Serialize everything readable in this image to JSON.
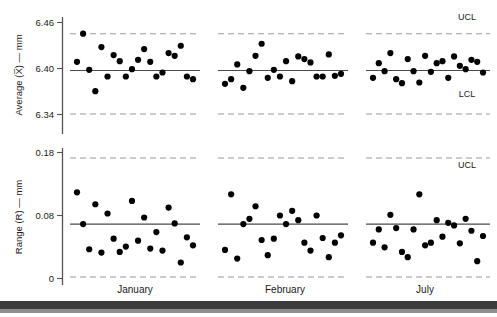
{
  "figure": {
    "title": "",
    "background_color": "#ffffff",
    "dot_color": "#000000",
    "center_line_color": "#4a4a4a",
    "limit_line_color": "#9a9a9a",
    "axis_color": "#555555",
    "footer_bar_color": "#3c3c3c",
    "footer_bar_shadow_color": "#8e8e8e"
  },
  "periods": [
    {
      "id": "january",
      "label": "January"
    },
    {
      "id": "february",
      "label": "February"
    },
    {
      "id": "july",
      "label": "July"
    }
  ],
  "limit_labels": {
    "ucl": "UCL",
    "lcl": "LCL"
  },
  "chart_data": [
    {
      "type": "scatter",
      "id": "xbar-chart",
      "title": "",
      "xlabel": "",
      "ylabel": "Average (X̅) — mm",
      "ylim": [
        6.31,
        6.485
      ],
      "yticks": [
        6.34,
        6.4,
        6.46
      ],
      "ytick_labels": [
        "6.34",
        "6.40",
        "6.46"
      ],
      "grid": false,
      "legend": "none",
      "center_line": 6.405,
      "control_limits": {
        "ucl": 6.46,
        "lcl": 6.34
      },
      "annotations": [
        "UCL",
        "LCL"
      ],
      "series": [
        {
          "name": "January",
          "x": [
            1,
            2,
            3,
            4,
            5,
            6,
            7,
            8,
            9,
            10,
            11,
            12,
            13,
            14,
            15,
            16,
            17,
            18,
            19,
            20
          ],
          "values": [
            6.418,
            6.46,
            6.406,
            6.374,
            6.44,
            6.396,
            6.428,
            6.419,
            6.396,
            6.407,
            6.421,
            6.437,
            6.418,
            6.396,
            6.402,
            6.431,
            6.427,
            6.442,
            6.396,
            6.392
          ]
        },
        {
          "name": "February",
          "x": [
            1,
            2,
            3,
            4,
            5,
            6,
            7,
            8,
            9,
            10,
            11,
            12,
            13,
            14,
            15,
            16,
            17,
            18,
            19,
            20
          ],
          "values": [
            6.385,
            6.392,
            6.414,
            6.379,
            6.404,
            6.427,
            6.445,
            6.394,
            6.406,
            6.396,
            6.419,
            6.389,
            6.426,
            6.422,
            6.417,
            6.396,
            6.396,
            6.429,
            6.397,
            6.4
          ]
        },
        {
          "name": "July",
          "x": [
            1,
            2,
            3,
            4,
            5,
            6,
            7,
            8,
            9,
            10,
            11,
            12,
            13,
            14,
            15,
            16,
            17,
            18,
            19,
            20
          ],
          "values": [
            6.394,
            6.416,
            6.404,
            6.431,
            6.392,
            6.386,
            6.422,
            6.404,
            6.387,
            6.427,
            6.403,
            6.416,
            6.419,
            6.394,
            6.426,
            6.412,
            6.407,
            6.421,
            6.418,
            6.402
          ]
        }
      ]
    },
    {
      "type": "scatter",
      "id": "range-chart",
      "title": "",
      "xlabel": "",
      "ylabel": "Range (R) — mm",
      "ylim": [
        -0.012,
        0.195
      ],
      "yticks": [
        0,
        0.08,
        0.18
      ],
      "ytick_labels": [
        "0",
        "0.08",
        "0.18"
      ],
      "grid": false,
      "legend": "none",
      "center_line": 0.08,
      "control_limits": {
        "ucl": 0.18,
        "lcl": 0.0
      },
      "annotations": [
        "UCL"
      ],
      "series": [
        {
          "name": "January",
          "x": [
            1,
            2,
            3,
            4,
            5,
            6,
            7,
            8,
            9,
            10,
            11,
            12,
            13,
            14,
            15,
            16,
            17,
            18,
            19,
            20
          ],
          "values": [
            0.128,
            0.08,
            0.042,
            0.11,
            0.037,
            0.096,
            0.058,
            0.038,
            0.046,
            0.115,
            0.055,
            0.09,
            0.043,
            0.068,
            0.04,
            0.105,
            0.081,
            0.022,
            0.06,
            0.048
          ]
        },
        {
          "name": "February",
          "x": [
            1,
            2,
            3,
            4,
            5,
            6,
            7,
            8,
            9,
            10,
            11,
            12,
            13,
            14,
            15,
            16,
            17,
            18,
            19,
            20
          ],
          "values": [
            0.041,
            0.125,
            0.028,
            0.08,
            0.088,
            0.107,
            0.056,
            0.033,
            0.058,
            0.093,
            0.08,
            0.1,
            0.086,
            0.052,
            0.04,
            0.093,
            0.059,
            0.03,
            0.052,
            0.063
          ]
        },
        {
          "name": "July",
          "x": [
            1,
            2,
            3,
            4,
            5,
            6,
            7,
            8,
            9,
            10,
            11,
            12,
            13,
            14,
            15,
            16,
            17,
            18,
            19,
            20
          ],
          "values": [
            0.052,
            0.072,
            0.045,
            0.094,
            0.074,
            0.038,
            0.03,
            0.072,
            0.125,
            0.048,
            0.052,
            0.086,
            0.061,
            0.082,
            0.078,
            0.051,
            0.088,
            0.07,
            0.024,
            0.062
          ]
        }
      ]
    }
  ]
}
